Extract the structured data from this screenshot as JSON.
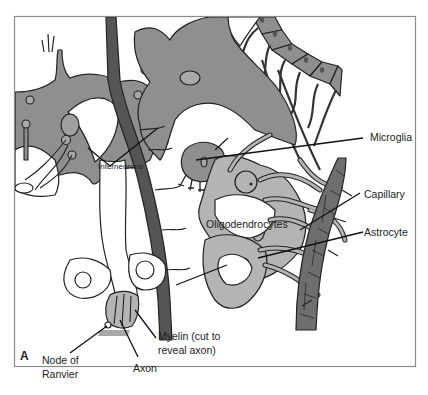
{
  "figure": {
    "panel_letter": "A",
    "colors": {
      "frame": "#8a8a8a",
      "neuron_fill": "#8f8f8f",
      "glia_fill": "#b4b4b4",
      "capillary_fill": "#6e6e6e",
      "vessel_dark": "#555555",
      "outline": "#222222",
      "background": "#ffffff"
    }
  },
  "labels": {
    "interneurons": "Interneurons",
    "microglia": "Microglia",
    "capillary": "Capillary",
    "astrocyte": "Astrocyte",
    "oligodendrocytes": "Oligodendrocytes",
    "myelin_line1": "Myelin (cut to",
    "myelin_line2": "reveal axon)",
    "node_line1": "Node of",
    "node_line2": "Ranvier",
    "axon": "Axon"
  }
}
